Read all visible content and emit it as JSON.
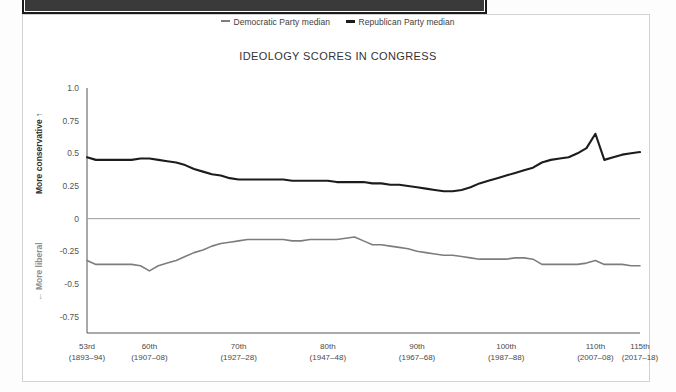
{
  "legend": {
    "items": [
      {
        "label": "Democratic Party median",
        "color": "#7d7d7d",
        "key": "democratic"
      },
      {
        "label": "Republican Party median",
        "color": "#1c1c1c",
        "key": "republican"
      }
    ]
  },
  "axis_captions": {
    "conservative": "More conservative",
    "conservative_arrow": "↑",
    "liberal": "More liberal",
    "liberal_arrow": "←"
  },
  "chart_data": {
    "type": "line",
    "title": "IDEOLOGY SCORES IN CONGRESS",
    "xlabel": "",
    "ylabel": "",
    "ylim": [
      -0.875,
      1.0
    ],
    "xlim": [
      53,
      115
    ],
    "grid": false,
    "legend_position": "top-center",
    "zero_line": 0,
    "ytick_values": [
      1.0,
      0.75,
      0.5,
      0.25,
      0,
      -0.25,
      -0.5,
      -0.75
    ],
    "ytick_labels": [
      "1.0",
      "0.75",
      "0.5",
      "0.25",
      "0",
      "-0.25",
      "-0.5",
      "-0.75"
    ],
    "xtick_values": [
      53,
      60,
      70,
      80,
      90,
      100,
      110,
      115
    ],
    "xtick_labels": [
      {
        "congress": "53rd",
        "years": "(1893–94)"
      },
      {
        "congress": "60th",
        "years": "(1907–08)"
      },
      {
        "congress": "70th",
        "years": "(1927–28)"
      },
      {
        "congress": "80th",
        "years": "(1947–48)"
      },
      {
        "congress": "90th",
        "years": "(1967–68)"
      },
      {
        "congress": "100th",
        "years": "(1987–88)"
      },
      {
        "congress": "110th",
        "years": "(2007–08)"
      },
      {
        "congress": "115th",
        "years": "(2017–18)"
      }
    ],
    "x": [
      53,
      54,
      55,
      56,
      57,
      58,
      59,
      60,
      61,
      62,
      63,
      64,
      65,
      66,
      67,
      68,
      69,
      70,
      71,
      72,
      73,
      74,
      75,
      76,
      77,
      78,
      79,
      80,
      81,
      82,
      83,
      84,
      85,
      86,
      87,
      88,
      89,
      90,
      91,
      92,
      93,
      94,
      95,
      96,
      97,
      98,
      99,
      100,
      101,
      102,
      103,
      104,
      105,
      106,
      107,
      108,
      109,
      110,
      111,
      112,
      113,
      114,
      115
    ],
    "series": [
      {
        "name": "Republican Party median",
        "color": "#1c1c1c",
        "width": 2.1,
        "values": [
          0.47,
          0.45,
          0.45,
          0.45,
          0.45,
          0.45,
          0.46,
          0.46,
          0.45,
          0.44,
          0.43,
          0.41,
          0.38,
          0.36,
          0.34,
          0.33,
          0.31,
          0.3,
          0.3,
          0.3,
          0.3,
          0.3,
          0.3,
          0.29,
          0.29,
          0.29,
          0.29,
          0.29,
          0.28,
          0.28,
          0.28,
          0.28,
          0.27,
          0.27,
          0.26,
          0.26,
          0.25,
          0.24,
          0.23,
          0.22,
          0.21,
          0.21,
          0.22,
          0.24,
          0.27,
          0.29,
          0.31,
          0.33,
          0.35,
          0.37,
          0.39,
          0.43,
          0.45,
          0.46,
          0.47,
          0.5,
          0.54,
          0.65,
          0.45,
          0.47,
          0.49,
          0.5,
          0.51
        ]
      },
      {
        "name": "Democratic Party median",
        "color": "#7d7d7d",
        "width": 1.6,
        "values": [
          -0.32,
          -0.35,
          -0.35,
          -0.35,
          -0.35,
          -0.35,
          -0.36,
          -0.4,
          -0.36,
          -0.34,
          -0.32,
          -0.29,
          -0.26,
          -0.24,
          -0.21,
          -0.19,
          -0.18,
          -0.17,
          -0.16,
          -0.16,
          -0.16,
          -0.16,
          -0.16,
          -0.17,
          -0.17,
          -0.16,
          -0.16,
          -0.16,
          -0.16,
          -0.15,
          -0.14,
          -0.17,
          -0.2,
          -0.2,
          -0.21,
          -0.22,
          -0.23,
          -0.25,
          -0.26,
          -0.27,
          -0.28,
          -0.28,
          -0.29,
          -0.3,
          -0.31,
          -0.31,
          -0.31,
          -0.31,
          -0.3,
          -0.3,
          -0.31,
          -0.35,
          -0.35,
          -0.35,
          -0.35,
          -0.35,
          -0.34,
          -0.32,
          -0.35,
          -0.35,
          -0.35,
          -0.36,
          -0.36
        ]
      }
    ]
  }
}
